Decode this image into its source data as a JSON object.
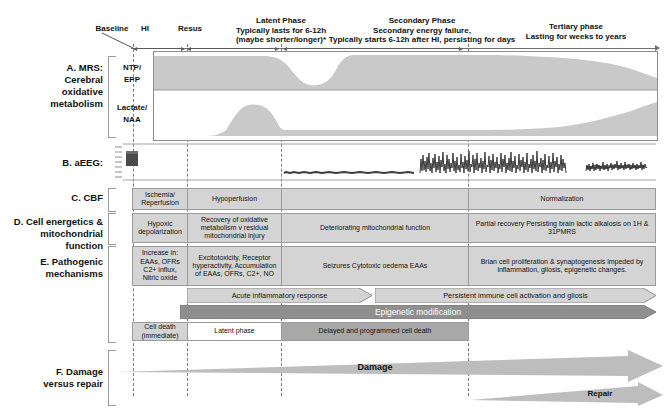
{
  "timeline": {
    "markers": [
      {
        "id": "baseline",
        "label": "Baseline"
      },
      {
        "id": "hi",
        "label": "HI"
      },
      {
        "id": "resus",
        "label": "Resus"
      }
    ],
    "phases": [
      {
        "id": "latent",
        "lines": [
          "Latent Phase",
          "Typically lasts for 6-12h",
          "(maybe shorter/longer)*"
        ]
      },
      {
        "id": "secondary",
        "lines": [
          "Secondary Phase",
          "Secondary energy failure,",
          "Typically starts 6-12h after HI, persisting for days"
        ]
      },
      {
        "id": "tertiary",
        "lines": [
          "Tertiary phase",
          "Lasting for weeks to years"
        ]
      }
    ]
  },
  "rows": {
    "a": {
      "label": [
        "A.  MRS:",
        "Cerebral",
        "oxidative",
        "metabolism"
      ],
      "traces": [
        {
          "id": "ntp-epp",
          "label": [
            "NTP/",
            "EPP"
          ]
        },
        {
          "id": "lactate-naa",
          "label": [
            "Lactate/",
            "NAA"
          ]
        }
      ]
    },
    "b": {
      "label": [
        "B. aEEG:"
      ]
    },
    "c": {
      "label": [
        "C. CBF"
      ],
      "cells": [
        {
          "text": "Ischemia/ Reperfusion",
          "fill": "gray"
        },
        {
          "text": "Hypoperfusion",
          "fill": "gray"
        },
        {
          "text": "",
          "fill": "gray"
        },
        {
          "text": "Normalization",
          "fill": "gray"
        }
      ]
    },
    "d": {
      "label": [
        "D. Cell energetics &",
        "mitochondrial function"
      ],
      "cells": [
        {
          "text": "Hypoxic depolarization",
          "fill": "gray"
        },
        {
          "text": "Recovery of oxidative metabolism v residual mitochondrial injury",
          "fill": "gray"
        },
        {
          "text": "Deteriorating mitochondrial function",
          "fill": "gray"
        },
        {
          "text": "Partial recovery Persisting brain lactic alkalosis on 1H & 31PMRS",
          "fill": "gray"
        }
      ]
    },
    "e": {
      "label": [
        "E. Pathogenic",
        "mechanisms"
      ],
      "cells": [
        {
          "text": "Increase in: EAAs, OFRs C2+ influx, Nitric oxide",
          "fill": "gray"
        },
        {
          "text": "Excitotoxicity, Receptor hyperactivity, Accumulation of EAAs, OFRs, C2+, NO",
          "fill": "gray"
        },
        {
          "text": "Seizures Cytotoxic oedema EAAs",
          "fill": "gray"
        },
        {
          "text": "Brian cell proliferation & synaptogenesis impeded by inflammation, gliosis, epigenetic changes.",
          "fill": "gray"
        }
      ],
      "arrows": [
        {
          "id": "acute-inflammatory",
          "text": "Acute inflammatory response",
          "tone": "light"
        },
        {
          "id": "persistent-immune",
          "text": "Persistent immune cell activation and gliosis",
          "tone": "light"
        },
        {
          "id": "epigenetic",
          "text": "Epigenetic modification",
          "tone": "dark"
        }
      ],
      "celldeath": [
        {
          "text": "Cell death (immediate)",
          "fill": "gray"
        },
        {
          "text": "Latent phase",
          "fill": "white"
        },
        {
          "text": "Delayed and programmed cell death",
          "fill": "dark"
        }
      ]
    },
    "f": {
      "label": [
        "F. Damage",
        "versus repair"
      ],
      "wedges": [
        {
          "id": "damage",
          "text": "Damage"
        },
        {
          "id": "repair",
          "text": "Repair"
        }
      ]
    }
  },
  "colors": {
    "fill_light": "#d4d4d4",
    "fill_mid": "#c2c2c2",
    "fill_dark": "#a8a8a8",
    "stroke": "#9b9b9b",
    "dash": "#7b7b7b",
    "text": "#111111"
  }
}
